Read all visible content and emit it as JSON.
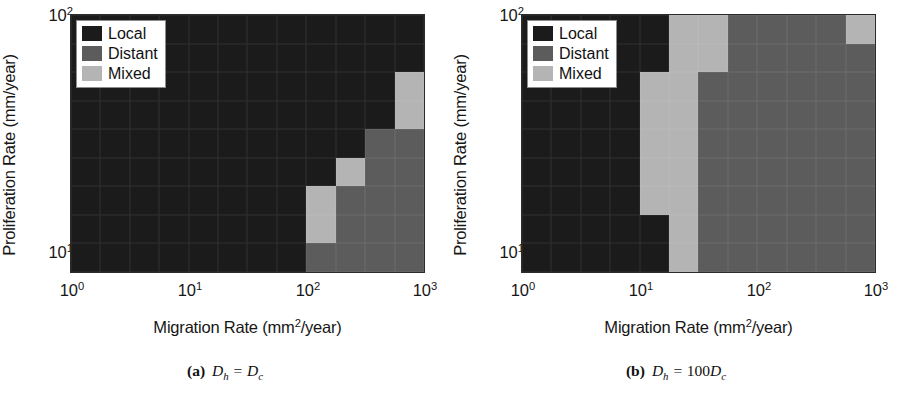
{
  "figure": {
    "legend": {
      "items": [
        {
          "label": "Local",
          "color": "#1b1b1b"
        },
        {
          "label": "Distant",
          "color": "#5c5c5c"
        },
        {
          "label": "Mixed",
          "color": "#b4b4b4"
        }
      ]
    },
    "axes": {
      "xlabel_prefix": "Migration Rate (mm",
      "xlabel_sup": "2",
      "xlabel_suffix": "/year)",
      "ylabel": "Proliferation Rate (mm/year)",
      "xticks": [
        {
          "base": "10",
          "exp": "0",
          "value": 1
        },
        {
          "base": "10",
          "exp": "1",
          "value": 10
        },
        {
          "base": "10",
          "exp": "2",
          "value": 100
        },
        {
          "base": "10",
          "exp": "3",
          "value": 1000
        }
      ],
      "yticks": [
        {
          "base": "10",
          "exp": "2",
          "value": 100
        },
        {
          "base": "10",
          "exp": "1",
          "value": 10
        }
      ]
    },
    "panels": [
      {
        "id": "a",
        "caption_tag": "(a)",
        "caption_lhs": "D",
        "caption_lhs_sub": "h",
        "caption_eq": " = ",
        "caption_coef": "",
        "caption_rhs": "D",
        "caption_rhs_sub": "c"
      },
      {
        "id": "b",
        "caption_tag": "(b)",
        "caption_lhs": "D",
        "caption_lhs_sub": "h",
        "caption_eq": " = ",
        "caption_coef": "100",
        "caption_rhs": "D",
        "caption_rhs_sub": "c"
      }
    ]
  },
  "chart_data": [
    {
      "type": "heatmap",
      "panel": "a",
      "title": "Dh = Dc",
      "xlabel": "Migration Rate (mm2/year)",
      "ylabel": "Proliferation Rate (mm/year)",
      "xscale": "log",
      "yscale": "log",
      "xlim": [
        1,
        1000
      ],
      "ylim": [
        8,
        120
      ],
      "grid": true,
      "legend_position": "top-left",
      "categories_legend": [
        "Local",
        "Distant",
        "Mixed"
      ],
      "category_colors": {
        "Local": "#1b1b1b",
        "Distant": "#5c5c5c",
        "Mixed": "#b4b4b4"
      },
      "ncols": 12,
      "nrows": 9,
      "row_order": "top-to-bottom (high proliferation to low proliferation)",
      "cells": [
        [
          "Local",
          "Local",
          "Local",
          "Local",
          "Local",
          "Local",
          "Local",
          "Local",
          "Local",
          "Local",
          "Local",
          "Local"
        ],
        [
          "Local",
          "Local",
          "Local",
          "Local",
          "Local",
          "Local",
          "Local",
          "Local",
          "Local",
          "Local",
          "Local",
          "Local"
        ],
        [
          "Local",
          "Local",
          "Local",
          "Local",
          "Local",
          "Local",
          "Local",
          "Local",
          "Local",
          "Local",
          "Local",
          "Mixed"
        ],
        [
          "Local",
          "Local",
          "Local",
          "Local",
          "Local",
          "Local",
          "Local",
          "Local",
          "Local",
          "Local",
          "Local",
          "Mixed"
        ],
        [
          "Local",
          "Local",
          "Local",
          "Local",
          "Local",
          "Local",
          "Local",
          "Local",
          "Local",
          "Local",
          "Distant",
          "Distant"
        ],
        [
          "Local",
          "Local",
          "Local",
          "Local",
          "Local",
          "Local",
          "Local",
          "Local",
          "Local",
          "Mixed",
          "Distant",
          "Distant"
        ],
        [
          "Local",
          "Local",
          "Local",
          "Local",
          "Local",
          "Local",
          "Local",
          "Local",
          "Mixed",
          "Distant",
          "Distant",
          "Distant"
        ],
        [
          "Local",
          "Local",
          "Local",
          "Local",
          "Local",
          "Local",
          "Local",
          "Local",
          "Mixed",
          "Distant",
          "Distant",
          "Distant"
        ],
        [
          "Local",
          "Local",
          "Local",
          "Local",
          "Local",
          "Local",
          "Local",
          "Local",
          "Distant",
          "Distant",
          "Distant",
          "Distant"
        ]
      ]
    },
    {
      "type": "heatmap",
      "panel": "b",
      "title": "Dh = 100 Dc",
      "xlabel": "Migration Rate (mm2/year)",
      "ylabel": "Proliferation Rate (mm/year)",
      "xscale": "log",
      "yscale": "log",
      "xlim": [
        1,
        1000
      ],
      "ylim": [
        8,
        120
      ],
      "grid": true,
      "legend_position": "top-left",
      "categories_legend": [
        "Local",
        "Distant",
        "Mixed"
      ],
      "category_colors": {
        "Local": "#1b1b1b",
        "Distant": "#5c5c5c",
        "Mixed": "#b4b4b4"
      },
      "ncols": 12,
      "nrows": 9,
      "row_order": "top-to-bottom (high proliferation to low proliferation)",
      "cells": [
        [
          "Local",
          "Local",
          "Local",
          "Local",
          "Local",
          "Mixed",
          "Mixed",
          "Distant",
          "Distant",
          "Distant",
          "Distant",
          "Mixed"
        ],
        [
          "Local",
          "Local",
          "Local",
          "Local",
          "Local",
          "Mixed",
          "Mixed",
          "Distant",
          "Distant",
          "Distant",
          "Distant",
          "Distant"
        ],
        [
          "Local",
          "Local",
          "Local",
          "Local",
          "Mixed",
          "Mixed",
          "Distant",
          "Distant",
          "Distant",
          "Distant",
          "Distant",
          "Distant"
        ],
        [
          "Local",
          "Local",
          "Local",
          "Local",
          "Mixed",
          "Mixed",
          "Distant",
          "Distant",
          "Distant",
          "Distant",
          "Distant",
          "Distant"
        ],
        [
          "Local",
          "Local",
          "Local",
          "Local",
          "Mixed",
          "Mixed",
          "Distant",
          "Distant",
          "Distant",
          "Distant",
          "Distant",
          "Distant"
        ],
        [
          "Local",
          "Local",
          "Local",
          "Local",
          "Mixed",
          "Mixed",
          "Distant",
          "Distant",
          "Distant",
          "Distant",
          "Distant",
          "Distant"
        ],
        [
          "Local",
          "Local",
          "Local",
          "Local",
          "Mixed",
          "Mixed",
          "Distant",
          "Distant",
          "Distant",
          "Distant",
          "Distant",
          "Distant"
        ],
        [
          "Local",
          "Local",
          "Local",
          "Local",
          "Local",
          "Mixed",
          "Distant",
          "Distant",
          "Distant",
          "Distant",
          "Distant",
          "Distant"
        ],
        [
          "Local",
          "Local",
          "Local",
          "Local",
          "Local",
          "Mixed",
          "Distant",
          "Distant",
          "Distant",
          "Distant",
          "Distant",
          "Distant"
        ]
      ]
    }
  ]
}
